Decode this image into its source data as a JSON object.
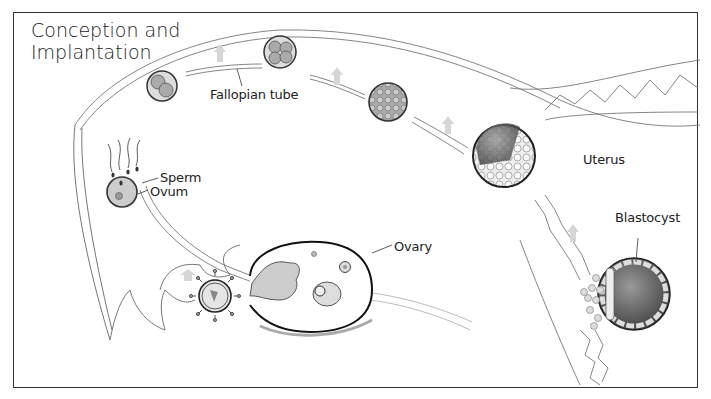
{
  "diagram": {
    "title_line1": "Conception and",
    "title_line2": "Implantation",
    "labels": {
      "fallopian_tube": "Fallopian tube",
      "sperm": "Sperm",
      "ovum": "Ovum",
      "ovary": "Ovary",
      "uterus": "Uterus",
      "blastocyst": "Blastocyst"
    },
    "colors": {
      "line": "#333333",
      "arrow_fill": "#cccccc",
      "cell_fill": "#bdbdbd",
      "dark_cell": "#555555",
      "background": "#ffffff"
    }
  }
}
